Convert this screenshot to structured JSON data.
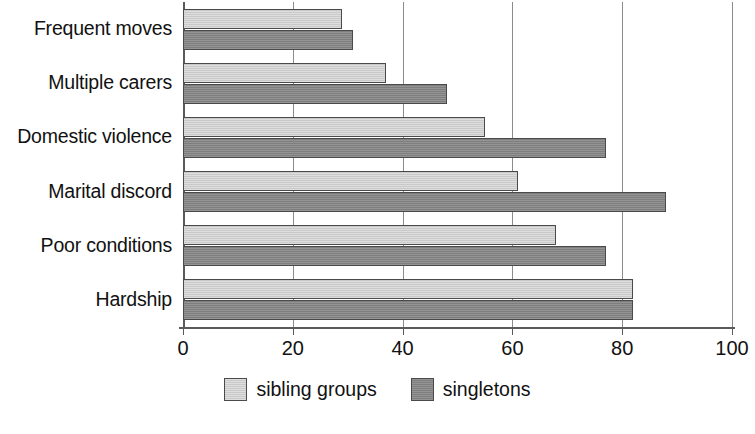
{
  "chart_data": {
    "type": "bar",
    "orientation": "horizontal",
    "title": "",
    "xlabel": "",
    "ylabel": "",
    "xlim": [
      0,
      100
    ],
    "xticks": [
      0,
      20,
      40,
      60,
      80,
      100
    ],
    "xtick_labels": [
      "0",
      "20",
      "40",
      "60",
      "80",
      "100"
    ],
    "grid": true,
    "grid_axis": "x",
    "legend_position": "bottom-center",
    "category_order_top_to_bottom": [
      "Frequent moves",
      "Multiple carers",
      "Domestic violence",
      "Marital discord",
      "Poor conditions",
      "Hardship"
    ],
    "categories": [
      "Hardship",
      "Poor conditions",
      "Marital discord",
      "Domestic violence",
      "Multiple carers",
      "Frequent moves"
    ],
    "series": [
      {
        "name": "sibling groups",
        "color": "#cdcdcd",
        "values": [
          82,
          68,
          61,
          55,
          37,
          29
        ]
      },
      {
        "name": "singletons",
        "color": "#858585",
        "values": [
          82,
          77,
          88,
          77,
          48,
          31
        ]
      }
    ]
  },
  "legend": {
    "items": [
      {
        "label": "sibling groups",
        "swatch": "light-gray-swatch"
      },
      {
        "label": "singletons",
        "swatch": "dark-gray-swatch"
      }
    ]
  },
  "colors": {
    "sibling_groups": "#cdcdcd",
    "singletons": "#858585",
    "axis": "#5a5a5a",
    "grid": "#8b8b8b",
    "text": "#111111",
    "background": "#ffffff"
  }
}
